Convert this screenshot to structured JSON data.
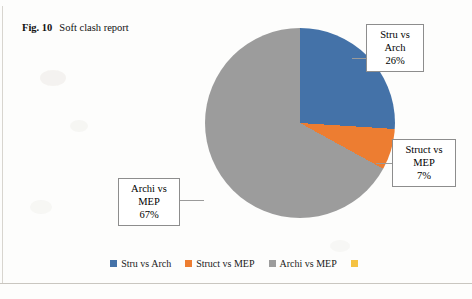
{
  "caption": {
    "figure_label": "Fig. 10",
    "text": "Soft clash report"
  },
  "chart_data": {
    "type": "pie",
    "title": "Soft clash report",
    "categories": [
      "Stru vs Arch",
      "Struct vs MEP",
      "Archi vs MEP"
    ],
    "values": [
      26,
      7,
      67
    ],
    "value_unit": "%",
    "colors": [
      "#4472a8",
      "#ed7d31",
      "#9c9c9c"
    ],
    "legend_position": "bottom",
    "start_angle_deg": 0,
    "labels": [
      {
        "name": "Stru vs Arch",
        "line1": "Stru vs",
        "line2": "Arch",
        "line3": "26%"
      },
      {
        "name": "Struct vs MEP",
        "line1": "Struct vs",
        "line2": "MEP",
        "line3": "7%"
      },
      {
        "name": "Archi vs MEP",
        "line1": "Archi vs",
        "line2": "MEP",
        "line3": "67%"
      }
    ]
  },
  "legend": {
    "items": [
      {
        "label": "Stru vs Arch",
        "color": "#4472a8"
      },
      {
        "label": "Struct vs MEP",
        "color": "#ed7d31"
      },
      {
        "label": "Archi vs MEP",
        "color": "#9c9c9c"
      },
      {
        "label": "",
        "color": "#f5c242"
      }
    ]
  },
  "callouts": {
    "stru_vs_arch": {
      "l1": "Stru vs",
      "l2": "Arch",
      "l3": "26%"
    },
    "struct_vs_mep": {
      "l1": "Struct vs",
      "l2": "MEP",
      "l3": "7%"
    },
    "archi_vs_mep": {
      "l1": "Archi vs",
      "l2": "MEP",
      "l3": "67%"
    }
  }
}
